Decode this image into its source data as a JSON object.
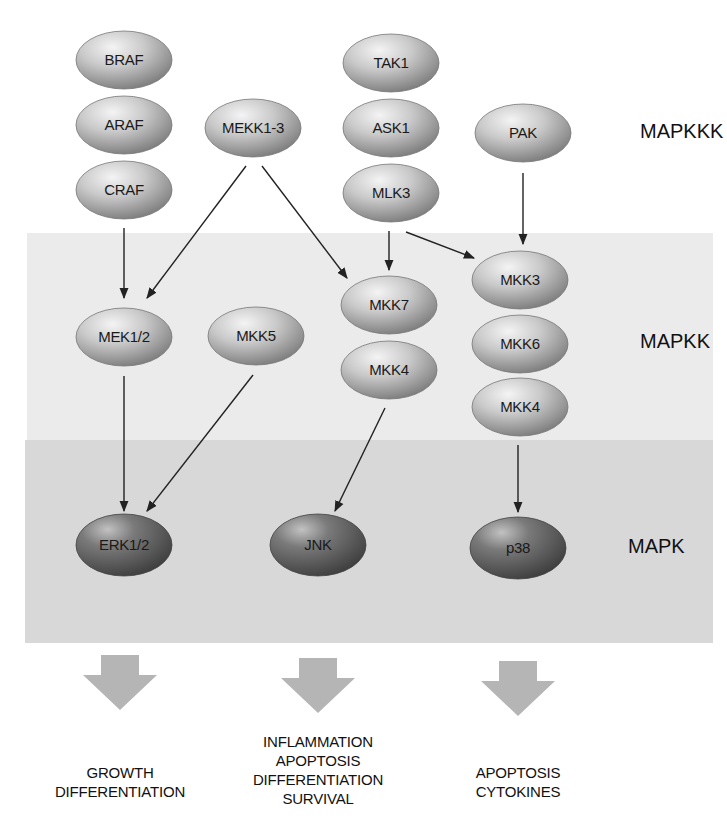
{
  "colors": {
    "background": "#ffffff",
    "mapkk_band": "#ebebeb",
    "mapk_band": "#d8d8d8",
    "node_light": "#c8c8c8",
    "node_dark": "#6a6a6a",
    "arrow": "#222222",
    "outcome_arrow": "#b5b5b5"
  },
  "levels": [
    {
      "id": "mapkkk",
      "label": "MAPKKK",
      "x": 640,
      "y": 138
    },
    {
      "id": "mapkk",
      "label": "MAPKK",
      "x": 640,
      "y": 348
    },
    {
      "id": "mapk",
      "label": "MAPK",
      "x": 628,
      "y": 553
    }
  ],
  "nodes": [
    {
      "id": "braf",
      "label": "BRAF",
      "level": "mapkkk",
      "x": 124,
      "y": 60
    },
    {
      "id": "araf",
      "label": "ARAF",
      "level": "mapkkk",
      "x": 124,
      "y": 125
    },
    {
      "id": "craf",
      "label": "CRAF",
      "level": "mapkkk",
      "x": 124,
      "y": 190
    },
    {
      "id": "mekk13",
      "label": "MEKK1-3",
      "level": "mapkkk",
      "x": 253,
      "y": 128
    },
    {
      "id": "tak1",
      "label": "TAK1",
      "level": "mapkkk",
      "x": 391,
      "y": 63
    },
    {
      "id": "ask1",
      "label": "ASK1",
      "level": "mapkkk",
      "x": 391,
      "y": 128
    },
    {
      "id": "mlk3",
      "label": "MLK3",
      "level": "mapkkk",
      "x": 391,
      "y": 193
    },
    {
      "id": "pak",
      "label": "PAK",
      "level": "mapkkk",
      "x": 523,
      "y": 133
    },
    {
      "id": "mek12",
      "label": "MEK1/2",
      "level": "mapkk",
      "x": 124,
      "y": 337
    },
    {
      "id": "mkk5",
      "label": "MKK5",
      "level": "mapkk",
      "x": 256,
      "y": 336
    },
    {
      "id": "mkk7",
      "label": "MKK7",
      "level": "mapkk",
      "x": 389,
      "y": 305
    },
    {
      "id": "mkk4a",
      "label": "MKK4",
      "level": "mapkk",
      "x": 389,
      "y": 370
    },
    {
      "id": "mkk3",
      "label": "MKK3",
      "level": "mapkk",
      "x": 520,
      "y": 280
    },
    {
      "id": "mkk6",
      "label": "MKK6",
      "level": "mapkk",
      "x": 520,
      "y": 344
    },
    {
      "id": "mkk4b",
      "label": "MKK4",
      "level": "mapkk",
      "x": 520,
      "y": 407
    },
    {
      "id": "erk12",
      "label": "ERK1/2",
      "level": "mapk",
      "x": 124,
      "y": 545
    },
    {
      "id": "jnk",
      "label": "JNK",
      "level": "mapk",
      "x": 318,
      "y": 545
    },
    {
      "id": "p38",
      "label": "p38",
      "level": "mapk",
      "x": 518,
      "y": 548
    }
  ],
  "edges": [
    {
      "from": "craf",
      "to": "mek12",
      "x1": 124,
      "y1": 228,
      "x2": 124,
      "y2": 298
    },
    {
      "from": "mekk13",
      "to": "mek12",
      "x1": 246,
      "y1": 166,
      "x2": 147,
      "y2": 298
    },
    {
      "from": "mekk13",
      "to": "mkk7",
      "x1": 262,
      "y1": 166,
      "x2": 347,
      "y2": 278
    },
    {
      "from": "mlk3",
      "to": "mkk7",
      "x1": 389,
      "y1": 231,
      "x2": 389,
      "y2": 270
    },
    {
      "from": "mlk3",
      "to": "mkk3",
      "x1": 406,
      "y1": 232,
      "x2": 474,
      "y2": 258
    },
    {
      "from": "pak",
      "to": "mkk3",
      "x1": 523,
      "y1": 173,
      "x2": 523,
      "y2": 244
    },
    {
      "from": "mek12",
      "to": "erk12",
      "x1": 124,
      "y1": 376,
      "x2": 124,
      "y2": 511
    },
    {
      "from": "mkk5",
      "to": "erk12",
      "x1": 253,
      "y1": 375,
      "x2": 147,
      "y2": 511
    },
    {
      "from": "mkk4a",
      "to": "jnk",
      "x1": 385,
      "y1": 408,
      "x2": 335,
      "y2": 511
    },
    {
      "from": "mkk4b",
      "to": "p38",
      "x1": 518,
      "y1": 445,
      "x2": 518,
      "y2": 512
    }
  ],
  "outcomes": [
    {
      "x": 120,
      "arrow_y": 655,
      "text_y": 763,
      "lines": [
        "GROWTH",
        "DIFFERENTIATION"
      ]
    },
    {
      "x": 318,
      "arrow_y": 658,
      "text_y": 732,
      "lines": [
        "INFLAMMATION",
        "APOPTOSIS",
        "DIFFERENTIATION",
        "SURVIVAL"
      ]
    },
    {
      "x": 518,
      "arrow_y": 661,
      "text_y": 763,
      "lines": [
        "APOPTOSIS",
        "CYTOKINES"
      ]
    }
  ]
}
